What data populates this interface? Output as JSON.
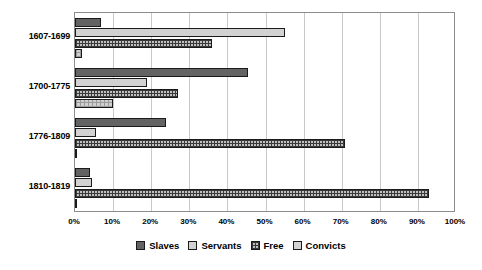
{
  "chart_data": {
    "type": "bar",
    "orientation": "horizontal",
    "title": "",
    "xlabel": "",
    "ylabel": "",
    "xlim": [
      0,
      100
    ],
    "xtick_labels": [
      "0%",
      "10%",
      "20%",
      "30%",
      "40%",
      "50%",
      "60%",
      "70%",
      "80%",
      "90%",
      "100%"
    ],
    "xtick_values": [
      0,
      10,
      20,
      30,
      40,
      50,
      60,
      70,
      80,
      90,
      100
    ],
    "grid": "vertical",
    "legend_position": "bottom",
    "categories": [
      "1607-1699",
      "1700-1775",
      "1776-1809",
      "1810-1819"
    ],
    "series": [
      {
        "name": "Slaves",
        "color": "#636363",
        "pattern": "solid-dark",
        "values": [
          6.8,
          45.5,
          24.0,
          4.0
        ]
      },
      {
        "name": "Servants",
        "color": "#d2d2d2",
        "pattern": "solid-light",
        "values": [
          55.0,
          19.0,
          5.5,
          4.5
        ]
      },
      {
        "name": "Free",
        "color": "#c0c0c0",
        "pattern": "crosshatch",
        "values": [
          36.0,
          27.0,
          70.8,
          93.0
        ]
      },
      {
        "name": "Convicts",
        "color": "#cfcfcf",
        "pattern": "fine-grid",
        "values": [
          1.8,
          10.0,
          0.6,
          0.4
        ]
      }
    ]
  },
  "legend": {
    "items": [
      {
        "label": "Slaves"
      },
      {
        "label": "Servants"
      },
      {
        "label": "Free"
      },
      {
        "label": "Convicts"
      }
    ]
  }
}
